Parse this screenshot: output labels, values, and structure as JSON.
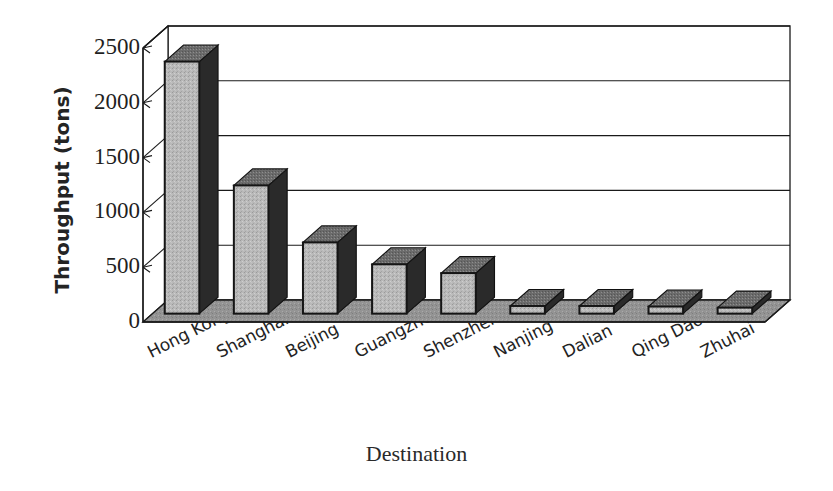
{
  "chart_data": {
    "type": "bar",
    "title": "",
    "subtitle": "",
    "xlabel": "Destination",
    "ylabel": "Throughput (tons)",
    "categories": [
      "Hong Kong",
      "Shanghai",
      "Beijing",
      "Guangzhou",
      "Shenzhen",
      "Nanjing",
      "Dalian",
      "Qing Dao",
      "Zhuhai"
    ],
    "values": [
      2300,
      1170,
      650,
      450,
      370,
      70,
      70,
      65,
      55
    ],
    "ylim": [
      0,
      2500
    ],
    "ytick_labels": [
      "0",
      "500",
      "1000",
      "1500",
      "2000",
      "2500"
    ],
    "ytick_values": [
      0,
      500,
      1000,
      1500,
      2000,
      2500
    ],
    "grid": true,
    "legend": "none",
    "style": "3d-column",
    "colors": {
      "bar_front": "#b4b4b4",
      "bar_side": "#2a2a2a",
      "bar_top": "#6f6f6f",
      "floor": "#8f8f8f",
      "frame": "#1a1a1a",
      "text": "#232323",
      "background": "#ffffff"
    }
  }
}
